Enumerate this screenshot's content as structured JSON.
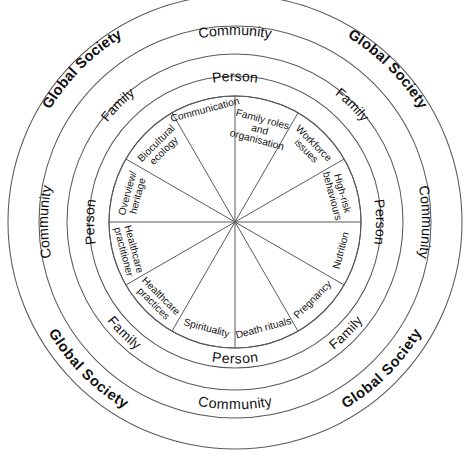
{
  "diagram": {
    "type": "concentric-circle-wheel",
    "center": {
      "x": 235,
      "y": 222
    },
    "stroke_color": "#5a5a5a",
    "background_color": "#ffffff",
    "text_color": "#111111"
  },
  "rings": [
    {
      "id": "global-society",
      "label": "Global Society",
      "level": 1,
      "bold": true,
      "outer_radius": 227,
      "inner_radius": 196,
      "label_positions": [
        "top-left",
        "top-right",
        "bottom-left",
        "bottom-right"
      ]
    },
    {
      "id": "community",
      "label": "Community",
      "level": 2,
      "bold": false,
      "outer_radius": 196,
      "inner_radius": 168,
      "label_positions": [
        "top",
        "left",
        "right",
        "bottom"
      ]
    },
    {
      "id": "family",
      "label": "Family",
      "level": 3,
      "bold": false,
      "outer_radius": 168,
      "inner_radius": 146,
      "label_positions": [
        "top-left",
        "top-right",
        "bottom-left",
        "bottom-right"
      ]
    },
    {
      "id": "person",
      "label": "Person",
      "level": 4,
      "bold": false,
      "outer_radius": 146,
      "inner_radius": 126,
      "label_positions": [
        "top",
        "left",
        "right",
        "bottom"
      ]
    }
  ],
  "wedges": {
    "radius": 126,
    "count": 12,
    "items": [
      {
        "index": 0,
        "label": "Overview/ heritage",
        "lines": [
          "Overview/",
          "heritage"
        ],
        "mid_angle_deg": -75
      },
      {
        "index": 1,
        "label": "Biocultural ecology",
        "lines": [
          "Biocultural",
          "ecology"
        ],
        "mid_angle_deg": -45
      },
      {
        "index": 2,
        "label": "Communication",
        "lines": [
          "Communication"
        ],
        "mid_angle_deg": -15
      },
      {
        "index": 3,
        "label": "Family roles and organisation",
        "lines": [
          "Family roles",
          "and",
          "organisation"
        ],
        "mid_angle_deg": 15
      },
      {
        "index": 4,
        "label": "Workforce issues",
        "lines": [
          "Workforce",
          "issues"
        ],
        "mid_angle_deg": 45
      },
      {
        "index": 5,
        "label": "High-risk behaviours",
        "lines": [
          "High-risk",
          "behaviours"
        ],
        "mid_angle_deg": 75
      },
      {
        "index": 6,
        "label": "Nutrition",
        "lines": [
          "Nutrition"
        ],
        "mid_angle_deg": 105
      },
      {
        "index": 7,
        "label": "Pregnancy",
        "lines": [
          "Pregnancy"
        ],
        "mid_angle_deg": 135
      },
      {
        "index": 8,
        "label": "Death rituals",
        "lines": [
          "Death rituals"
        ],
        "mid_angle_deg": 165
      },
      {
        "index": 9,
        "label": "Spirituality",
        "lines": [
          "Spirituality"
        ],
        "mid_angle_deg": 195
      },
      {
        "index": 10,
        "label": "Healthcare practices",
        "lines": [
          "Healthcare",
          "practices"
        ],
        "mid_angle_deg": 225
      },
      {
        "index": 11,
        "label": "Healthcare practitioner",
        "lines": [
          "Healthcare",
          "practitioner"
        ],
        "mid_angle_deg": 255
      }
    ]
  },
  "ring_label_text": {
    "global_society": "Global Society",
    "community": "Community",
    "family": "Family",
    "person": "Person"
  }
}
